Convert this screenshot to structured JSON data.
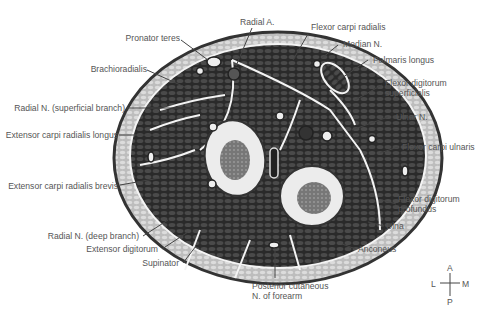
{
  "figure": {
    "labels_left": {
      "pronator_teres": "Pronator teres",
      "brachioradialis": "Brachioradialis",
      "radial_n_superficial": "Radial N. (superficial branch)",
      "ecr_longus": "Extensor carpi radialis longus",
      "ecr_brevis": "Extensor carpi radialis brevis",
      "radial_n_deep": "Radial N. (deep branch)",
      "extensor_digitorum": "Extensor digitorum",
      "supinator": "Supinator"
    },
    "labels_top": {
      "radial_a": "Radial A.",
      "fcr": "Flexor carpi radialis",
      "median_n": "Median N.",
      "palmaris_longus": "Palmaris longus"
    },
    "labels_right": {
      "fds_1": "Flexor digitorum",
      "fds_2": "superficialis",
      "ulnar_n": "Ulnar N.",
      "fcu": "Flexor carpi ulnaris",
      "fdp_1": "Flexor digitorum",
      "fdp_2": "profundus",
      "ulna": "Ulna",
      "anconeus": "Anconeus"
    },
    "labels_bottom": {
      "pcn_1": "Posterior cutaneous",
      "pcn_2": "N. of forearm"
    },
    "compass": {
      "A": "A",
      "P": "P",
      "L": "L",
      "M": "M"
    },
    "colors": {
      "skin_outline": "#3a3a3a",
      "fat": "#c9c9c9",
      "muscle": "#2e2e2e",
      "fascia": "#f2f2f2",
      "bone": "#e8e8e8",
      "marrow": "#777777",
      "label_text": "#555555",
      "leader": "#444444"
    }
  }
}
